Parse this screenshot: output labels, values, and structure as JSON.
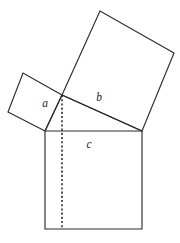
{
  "figure": {
    "canvas": {
      "width": 180,
      "height": 243
    },
    "style": {
      "stroke_color": "#2b2b2b",
      "fill_color": "#ffffff",
      "background": "#ffffff",
      "dashed_color": "#242424",
      "label_color": "#1c1c1c"
    },
    "labels": {
      "a": "a",
      "b": "b",
      "c": "c"
    },
    "label_positions": {
      "a": {
        "x": 45,
        "y": 104
      },
      "b": {
        "x": 99,
        "y": 98
      },
      "c": {
        "x": 89,
        "y": 145
      }
    },
    "triangle": {
      "name": "right-triangle",
      "vertices": [
        {
          "x": 62,
          "y": 95
        },
        {
          "x": 142,
          "y": 131
        },
        {
          "x": 45,
          "y": 131
        }
      ],
      "right_angle_at": {
        "x": 62,
        "y": 95
      }
    },
    "square_a": {
      "name": "square-on-leg-a",
      "points": "62,95 23,73 8,112 45,131"
    },
    "square_b": {
      "name": "square-on-leg-b",
      "points": "62,95 100,11 174,53 142,131"
    },
    "square_c": {
      "name": "square-on-hypotenuse-c",
      "points": "45,131 142,131 142,229 45,229"
    },
    "hypotenuse": {
      "name": "hypotenuse-segment",
      "from": {
        "x": 62,
        "y": 95
      },
      "to": {
        "x": 142,
        "y": 131
      }
    },
    "leg_segment": {
      "name": "leg-segment-a",
      "from": {
        "x": 62,
        "y": 95
      },
      "to": {
        "x": 45,
        "y": 131
      }
    },
    "altitude": {
      "name": "altitude-dashed-line",
      "from": {
        "x": 62,
        "y": 95
      },
      "to": {
        "x": 62,
        "y": 229
      }
    }
  }
}
